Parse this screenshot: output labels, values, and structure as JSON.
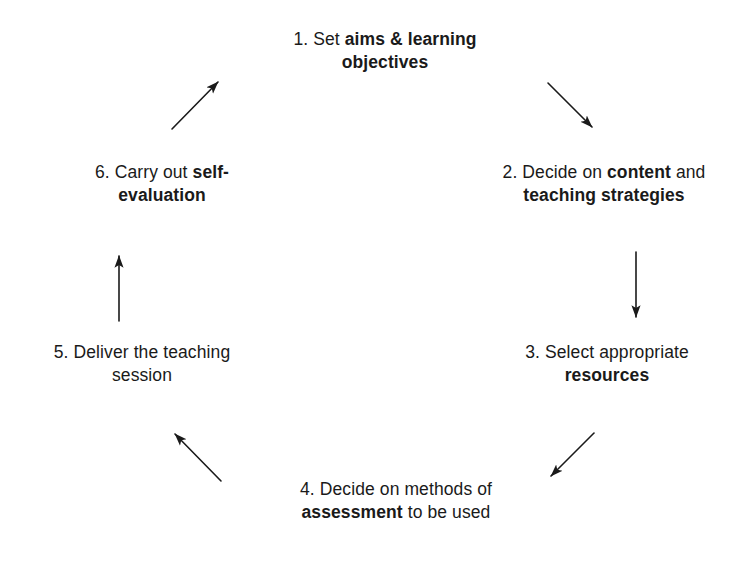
{
  "diagram": {
    "type": "cycle",
    "background_color": "#ffffff",
    "text_color": "#1a1a1a",
    "arrow_color": "#1a1a1a",
    "nodes": [
      {
        "id": "step-1",
        "number": "1.",
        "line1_plain_a": "1. Set ",
        "line1_bold": "aims & learning",
        "line2_bold": "objectives",
        "full_text": "1. Set aims & learning objectives"
      },
      {
        "id": "step-2",
        "number": "2.",
        "line1_plain_a": "2. Decide on ",
        "line1_bold": "content",
        "line1_plain_b": " and",
        "line2_bold": "teaching strategies",
        "full_text": "2. Decide on content and teaching strategies"
      },
      {
        "id": "step-3",
        "number": "3.",
        "line1_plain_a": "3. Select appropriate",
        "line2_bold": "resources",
        "full_text": "3. Select appropriate resources"
      },
      {
        "id": "step-4",
        "number": "4.",
        "line1_plain_a": "4. Decide on methods of",
        "line2_bold": "assessment",
        "line2_plain_b": " to be used",
        "full_text": "4. Decide on methods of assessment to be used"
      },
      {
        "id": "step-5",
        "number": "5.",
        "line1_plain_a": "5. Deliver the teaching",
        "line2_plain": "session",
        "full_text": "5. Deliver the teaching session"
      },
      {
        "id": "step-6",
        "number": "6.",
        "line1_plain_a": "6. Carry out ",
        "line1_bold": "self-",
        "line2_bold": "evaluation",
        "full_text": "6. Carry out self-evaluation"
      }
    ],
    "arrows": [
      {
        "id": "arrow-1-to-2",
        "from": "step-1",
        "to": "step-2",
        "x1": 548,
        "y1": 83,
        "x2": 592,
        "y2": 127,
        "direction": "down-right"
      },
      {
        "id": "arrow-2-to-3",
        "from": "step-2",
        "to": "step-3",
        "x1": 636,
        "y1": 252,
        "x2": 636,
        "y2": 317,
        "direction": "down"
      },
      {
        "id": "arrow-3-to-4",
        "from": "step-3",
        "to": "step-4",
        "x1": 594,
        "y1": 433,
        "x2": 551,
        "y2": 476,
        "direction": "down-left"
      },
      {
        "id": "arrow-4-to-5",
        "from": "step-4",
        "to": "step-5",
        "x1": 221,
        "y1": 481,
        "x2": 175,
        "y2": 434,
        "direction": "up-left"
      },
      {
        "id": "arrow-5-to-6",
        "from": "step-5",
        "to": "step-6",
        "x1": 119,
        "y1": 321,
        "x2": 119,
        "y2": 256,
        "direction": "up"
      },
      {
        "id": "arrow-6-to-1",
        "from": "step-6",
        "to": "step-1",
        "x1": 172,
        "y1": 129,
        "x2": 218,
        "y2": 82,
        "direction": "up-right"
      }
    ]
  }
}
